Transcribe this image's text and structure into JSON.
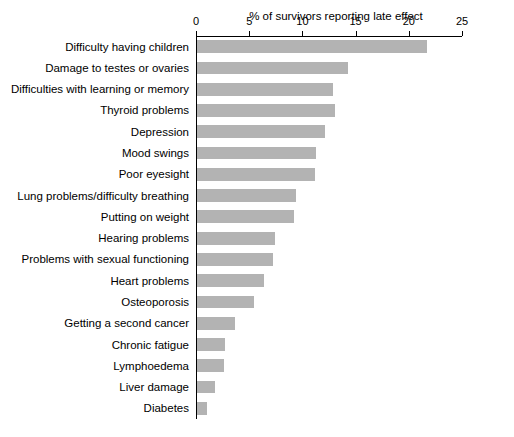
{
  "chart_data": {
    "type": "bar",
    "orientation": "horizontal",
    "title": "% of survivors reporting late effect",
    "xlabel": "",
    "ylabel": "",
    "xlim": [
      0,
      25
    ],
    "ticks": [
      0,
      5,
      10,
      15,
      20,
      25
    ],
    "tick_labels": [
      "0",
      "5",
      "10",
      "15",
      "20",
      "25"
    ],
    "grid": false,
    "bar_color": "#b3b3b3",
    "categories": [
      "Difficulty having children",
      "Damage to testes or ovaries",
      "Difficulties with learning or memory",
      "Thyroid problems",
      "Depression",
      "Mood swings",
      "Poor eyesight",
      "Lung problems/difficulty breathing",
      "Putting on weight",
      "Hearing problems",
      "Problems with sexual functioning",
      "Heart problems",
      "Osteoporosis",
      "Getting a second cancer",
      "Chronic fatigue",
      "Lymphoedema",
      "Liver damage",
      "Diabetes"
    ],
    "values": [
      21.6,
      14.2,
      12.8,
      13.0,
      12.0,
      11.2,
      11.1,
      9.3,
      9.1,
      7.3,
      7.1,
      6.3,
      5.4,
      3.6,
      2.6,
      2.5,
      1.7,
      0.9
    ]
  }
}
